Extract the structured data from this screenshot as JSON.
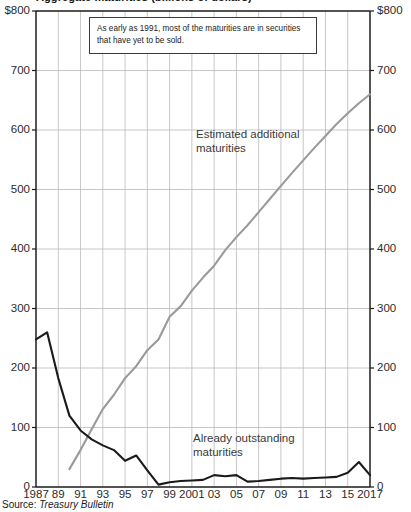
{
  "chart_data": {
    "type": "line",
    "title": "Aggregate maturities (billions of dollars)",
    "xlabel": "",
    "ylabel": "",
    "ylim": [
      0,
      800
    ],
    "xlim": [
      1987,
      2017
    ],
    "grid": true,
    "legend_position": "inline-annotation",
    "y_unit_prefix": "$",
    "y_ticks": [
      0,
      100,
      200,
      300,
      400,
      500,
      600,
      700,
      800
    ],
    "y_tick_labels_left": [
      "0",
      "100",
      "200",
      "300",
      "400",
      "500",
      "600",
      "700",
      "$800"
    ],
    "y_tick_labels_right": [
      "0",
      "100",
      "200",
      "300",
      "400",
      "500",
      "600",
      "700",
      "$800"
    ],
    "x_ticks": [
      1987,
      1989,
      1991,
      1993,
      1995,
      1997,
      1999,
      2001,
      2003,
      2005,
      2007,
      2009,
      2011,
      2013,
      2015,
      2017
    ],
    "x_tick_labels": [
      "1987",
      "89",
      "91",
      "93",
      "95",
      "97",
      "99",
      "2001",
      "03",
      "05",
      "07",
      "09",
      "11",
      "13",
      "15",
      "2017"
    ],
    "x": [
      1987,
      1988,
      1989,
      1990,
      1991,
      1992,
      1993,
      1994,
      1995,
      1996,
      1997,
      1998,
      1999,
      2000,
      2001,
      2002,
      2003,
      2004,
      2005,
      2006,
      2007,
      2008,
      2009,
      2010,
      2011,
      2012,
      2013,
      2014,
      2015,
      2016,
      2017
    ],
    "series": [
      {
        "name": "Already outstanding maturities",
        "color": "#1a1a1a",
        "width": 2.1,
        "values": [
          248,
          260,
          183,
          120,
          95,
          80,
          70,
          62,
          44,
          53,
          28,
          4,
          8,
          10,
          11,
          12,
          20,
          18,
          20,
          9,
          10,
          12,
          14,
          15,
          14,
          15,
          16,
          17,
          24,
          42,
          20
        ]
      },
      {
        "name": "Estimated additional maturities",
        "color": "#9a9a9a",
        "width": 2.1,
        "values": [
          null,
          null,
          null,
          30,
          62,
          97,
          131,
          155,
          183,
          203,
          230,
          248,
          286,
          304,
          330,
          352,
          372,
          398,
          420,
          440,
          462,
          484,
          506,
          528,
          549,
          570,
          590,
          610,
          628,
          645,
          660
        ]
      }
    ],
    "annotations": [
      {
        "id": "callout",
        "text": "As early as 1991, most of the maturities are in securities that have yet to be sold."
      },
      {
        "id": "label-estimated",
        "text": "Estimated additional\nmaturities"
      },
      {
        "id": "label-outstanding",
        "text": "Already outstanding\nmaturities"
      }
    ],
    "source_prefix": "Source:",
    "source_value": "Treasury Bulletin"
  }
}
